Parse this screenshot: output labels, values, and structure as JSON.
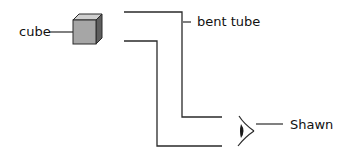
{
  "diagram": {
    "labels": {
      "cube": "cube",
      "tube": "bent tube",
      "observer": "Shawn"
    },
    "colors": {
      "line": "#2a2a2a",
      "cube_front": "#a6a6a6",
      "cube_top": "#d0d0d0",
      "cube_side": "#5e5e5e",
      "text": "#111111",
      "background": "#ffffff"
    }
  }
}
